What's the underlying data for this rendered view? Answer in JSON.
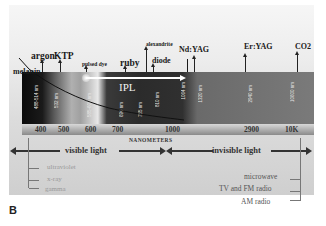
{
  "figure": {
    "panel_label": "B",
    "chromophore": "melanin",
    "ipl_label": "IPL",
    "lasers": [
      {
        "name": "argon"
      },
      {
        "name": "KTP"
      },
      {
        "name": "pulsed dye"
      },
      {
        "name": "ruby"
      },
      {
        "name": "alexandrite"
      },
      {
        "name": "diode"
      },
      {
        "name": "Nd:YAG"
      },
      {
        "name": "Er:YAG"
      },
      {
        "name": "CO2"
      }
    ],
    "band_labels": [
      "488-514 nm",
      "532 nm",
      "585-600 nm",
      "694 nm",
      "755 nm",
      "810 nm",
      "1064 nm",
      "1320 nm",
      "2940 nm",
      "10600 nm"
    ],
    "axis": {
      "ticks": [
        "400",
        "500",
        "600",
        "700",
        "1000",
        "2900",
        "10K"
      ],
      "title": "NANOMETERS"
    },
    "ranges": {
      "visible": "visible light",
      "invisible": "invisible light"
    },
    "left_spectrum": [
      "ultraviolet",
      "x-ray",
      "gamma"
    ],
    "right_spectrum": [
      "microwave",
      "TV and FM radio",
      "AM radio"
    ]
  }
}
